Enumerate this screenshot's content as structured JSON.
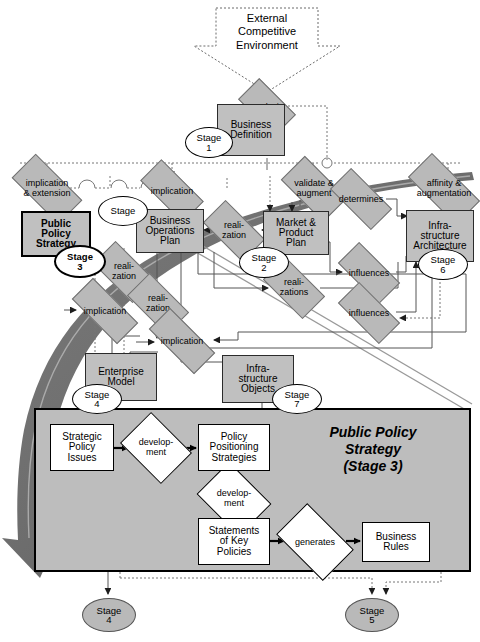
{
  "diagram": {
    "colors": {
      "node_fill": "#c0c0c0",
      "diamond_fill": "#b9b9b9",
      "panel_fill": "#bdbdbd",
      "swoosh": "#6e6e6e",
      "line": "#555555",
      "text": "#000000"
    }
  },
  "top": {
    "external": "External\nCompetitive\nEnvironment",
    "external_l1": "External",
    "external_l2": "Competitive",
    "external_l3": "Environment",
    "analysis": "analysis",
    "business_definition_l1": "Business",
    "business_definition_l2": "Definition"
  },
  "nodes": [
    {
      "id": "business-definition",
      "l1": "Business",
      "l2": "Definition",
      "l3": "",
      "stage": "1"
    },
    {
      "id": "public-policy-strategy",
      "l1": "Public",
      "l2": "Policy",
      "l3": "Strategy",
      "stage": "3"
    },
    {
      "id": "business-operations-plan",
      "l1": "Business",
      "l2": "Operations",
      "l3": "Plan",
      "stage": ""
    },
    {
      "id": "market-product-plan",
      "l1": "Market &",
      "l2": "Product",
      "l3": "Plan",
      "stage": "2"
    },
    {
      "id": "infrastructure-architecture",
      "l1": "Infra-",
      "l2": "structure",
      "l3": "Architecture",
      "stage": "6"
    },
    {
      "id": "enterprise-model",
      "l1": "Enterprise",
      "l2": "Model",
      "l3": "",
      "stage": "4"
    },
    {
      "id": "infrastructure-objects",
      "l1": "Infra-",
      "l2": "structure",
      "l3": "Objects",
      "stage": "7"
    }
  ],
  "stage_labels": {
    "word": "Stage",
    "s1": "1",
    "s2": "2",
    "s3": "3",
    "s4": "4",
    "s5": "5",
    "s6": "6",
    "s_blank": ""
  },
  "relations": [
    {
      "id": "analysis",
      "label": "analysis"
    },
    {
      "id": "implication-extension",
      "l1": "implication",
      "l2": "& extension"
    },
    {
      "id": "implication-top",
      "label": "implication"
    },
    {
      "id": "validate-augment",
      "l1": "validate &",
      "l2": "augment"
    },
    {
      "id": "affinity-augmentation",
      "l1": "affinity &",
      "l2": "augmentation"
    },
    {
      "id": "determines",
      "label": "determines"
    },
    {
      "id": "realization-bop-mpp",
      "l1": "reali-",
      "l2": "zation"
    },
    {
      "id": "realization-pps-left",
      "l1": "reali-",
      "l2": "zation"
    },
    {
      "id": "realization-bop-down",
      "l1": "reali-",
      "l2": "zation"
    },
    {
      "id": "realizations",
      "l1": "reali-",
      "l2": "zations"
    },
    {
      "id": "influences-upper",
      "label": "influences"
    },
    {
      "id": "influences-lower",
      "label": "influences"
    },
    {
      "id": "implication-pps",
      "label": "implication"
    },
    {
      "id": "implication-lower",
      "label": "implication"
    }
  ],
  "panel": {
    "title_l1": "Public Policy",
    "title_l2": "Strategy",
    "title_l3": "(Stage 3)",
    "boxes": [
      {
        "id": "strategic-policy-issues",
        "l1": "Strategic",
        "l2": "Policy",
        "l3": "Issues"
      },
      {
        "id": "policy-positioning-strategies",
        "l1": "Policy",
        "l2": "Positioning",
        "l3": "Strategies"
      },
      {
        "id": "statements-of-key-policies",
        "l1": "Statements",
        "l2": "of Key",
        "l3": "Policies"
      },
      {
        "id": "business-rules",
        "l1": "Business",
        "l2": "Rules",
        "l3": ""
      }
    ],
    "diamonds": [
      {
        "id": "development-1",
        "l1": "develop-",
        "l2": "ment"
      },
      {
        "id": "development-2",
        "l1": "develop-",
        "l2": "ment"
      },
      {
        "id": "generates",
        "l1": "generates",
        "l2": ""
      }
    ]
  },
  "bottom_stages": [
    {
      "id": "stage-4",
      "word": "Stage",
      "num": "4"
    },
    {
      "id": "stage-5",
      "word": "Stage",
      "num": "5"
    }
  ]
}
